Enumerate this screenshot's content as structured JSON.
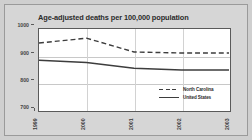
{
  "figure": {
    "title": "Age-adjusted deaths per 100,000 population",
    "background_color": "#d6d6d6",
    "plot_background_color": "#ffffff",
    "border_color": "#5a5a5a"
  },
  "chart_data": {
    "type": "line",
    "title": "Age-adjusted deaths per 100,000 population",
    "xlabel": "",
    "ylabel": "",
    "categories": [
      "1999",
      "2000",
      "2001",
      "2002",
      "2003"
    ],
    "x": [
      1999,
      2000,
      2001,
      2002,
      2003
    ],
    "ylim": [
      700,
      1000
    ],
    "xlim": [
      1999,
      2003
    ],
    "yticks": [
      700,
      800,
      900,
      1000
    ],
    "ytick_labels": [
      "700",
      "800",
      "900",
      "1000"
    ],
    "xtick_labels": [
      "1999",
      "2000",
      "2001",
      "2002",
      "2003"
    ],
    "grid": true,
    "grid_axis": "both",
    "legend_position": "lower-right-inside",
    "series": [
      {
        "name": "North Carolina",
        "values": [
          948,
          966,
          915,
          911,
          911
        ],
        "style": "dashed",
        "color": "#3d3d3d"
      },
      {
        "name": "United States",
        "values": [
          884,
          876,
          855,
          848,
          848
        ],
        "style": "solid",
        "color": "#3d3d3d"
      }
    ]
  },
  "legend": {
    "items": [
      {
        "label": "North Carolina",
        "style": "dashed"
      },
      {
        "label": "United States",
        "style": "solid"
      }
    ]
  },
  "axes": {
    "y_labels": [
      "1000",
      "900",
      "800",
      "700"
    ],
    "x_labels": [
      "1999",
      "2000",
      "2001",
      "2002",
      "2003"
    ]
  }
}
